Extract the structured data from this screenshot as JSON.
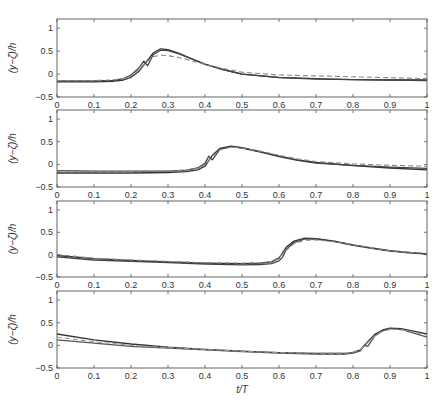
{
  "chart_data": [
    {
      "type": "line",
      "panel": 1,
      "ylabel": "(y−ζ)/h",
      "xlabel": "",
      "xlim": [
        0,
        1
      ],
      "ylim": [
        -0.5,
        1.2
      ],
      "xticks": [
        "0",
        "0.1",
        "0.2",
        "0.3",
        "0.4",
        "0.5",
        "0.6",
        "0.7",
        "0.8",
        "0.9",
        "1"
      ],
      "yticks": [
        "−0.5",
        "0",
        "0.5",
        "1"
      ],
      "series": [
        {
          "name": "solid-1",
          "style": "solid",
          "color": "#333333",
          "x": [
            0,
            0.1,
            0.15,
            0.18,
            0.2,
            0.22,
            0.24,
            0.26,
            0.28,
            0.3,
            0.33,
            0.36,
            0.4,
            0.45,
            0.5,
            0.6,
            0.7,
            0.8,
            0.9,
            1.0
          ],
          "y": [
            -0.17,
            -0.17,
            -0.16,
            -0.13,
            -0.07,
            0.05,
            0.25,
            0.46,
            0.55,
            0.53,
            0.45,
            0.35,
            0.22,
            0.1,
            0.0,
            -0.07,
            -0.1,
            -0.12,
            -0.13,
            -0.13
          ]
        },
        {
          "name": "solid-2",
          "style": "solid",
          "color": "#444444",
          "x": [
            0,
            0.1,
            0.15,
            0.18,
            0.2,
            0.22,
            0.235,
            0.245,
            0.26,
            0.28,
            0.3,
            0.33,
            0.36,
            0.4,
            0.45,
            0.5,
            0.6,
            0.7,
            0.8,
            0.9,
            1.0
          ],
          "y": [
            -0.15,
            -0.15,
            -0.14,
            -0.1,
            -0.02,
            0.12,
            0.28,
            0.18,
            0.42,
            0.52,
            0.51,
            0.44,
            0.34,
            0.21,
            0.09,
            0.0,
            -0.08,
            -0.11,
            -0.12,
            -0.13,
            -0.14
          ]
        },
        {
          "name": "dashed",
          "style": "dashed",
          "color": "#888888",
          "x": [
            0,
            0.1,
            0.15,
            0.18,
            0.2,
            0.22,
            0.24,
            0.26,
            0.28,
            0.3,
            0.33,
            0.36,
            0.4,
            0.45,
            0.5,
            0.6,
            0.7,
            0.8,
            0.9,
            1.0
          ],
          "y": [
            -0.14,
            -0.14,
            -0.13,
            -0.1,
            -0.04,
            0.08,
            0.25,
            0.38,
            0.41,
            0.4,
            0.36,
            0.3,
            0.21,
            0.12,
            0.04,
            -0.02,
            -0.04,
            -0.06,
            -0.08,
            -0.1
          ]
        }
      ]
    },
    {
      "type": "line",
      "panel": 2,
      "ylabel": "(y−ζ)/h",
      "xlabel": "",
      "xlim": [
        0,
        1
      ],
      "ylim": [
        -0.5,
        1.2
      ],
      "xticks": [
        "0",
        "0.1",
        "0.2",
        "0.3",
        "0.4",
        "0.5",
        "0.6",
        "0.7",
        "0.8",
        "0.9",
        "1"
      ],
      "yticks": [
        "−0.5",
        "0",
        "0.5",
        "1"
      ],
      "series": [
        {
          "name": "solid-1",
          "style": "solid",
          "color": "#333333",
          "x": [
            0,
            0.1,
            0.2,
            0.3,
            0.35,
            0.38,
            0.4,
            0.42,
            0.44,
            0.47,
            0.5,
            0.55,
            0.6,
            0.65,
            0.7,
            0.8,
            0.9,
            1.0
          ],
          "y": [
            -0.19,
            -0.19,
            -0.19,
            -0.18,
            -0.16,
            -0.12,
            -0.04,
            0.2,
            0.35,
            0.4,
            0.37,
            0.28,
            0.18,
            0.1,
            0.04,
            -0.03,
            -0.08,
            -0.12
          ]
        },
        {
          "name": "solid-2",
          "style": "solid",
          "color": "#444444",
          "x": [
            0,
            0.1,
            0.2,
            0.3,
            0.35,
            0.38,
            0.4,
            0.41,
            0.42,
            0.44,
            0.47,
            0.5,
            0.55,
            0.6,
            0.65,
            0.7,
            0.8,
            0.9,
            1.0
          ],
          "y": [
            -0.14,
            -0.15,
            -0.15,
            -0.15,
            -0.13,
            -0.08,
            0.02,
            0.18,
            0.1,
            0.33,
            0.39,
            0.36,
            0.27,
            0.17,
            0.09,
            0.03,
            -0.02,
            -0.06,
            -0.09
          ]
        },
        {
          "name": "dashed",
          "style": "dashed",
          "color": "#888888",
          "x": [
            0,
            0.1,
            0.2,
            0.3,
            0.35,
            0.38,
            0.4,
            0.42,
            0.44,
            0.47,
            0.5,
            0.55,
            0.6,
            0.65,
            0.7,
            0.8,
            0.9,
            1.0
          ],
          "y": [
            -0.15,
            -0.16,
            -0.16,
            -0.15,
            -0.13,
            -0.09,
            0.0,
            0.18,
            0.32,
            0.38,
            0.36,
            0.29,
            0.2,
            0.12,
            0.06,
            0.01,
            -0.02,
            -0.04
          ]
        }
      ]
    },
    {
      "type": "line",
      "panel": 3,
      "ylabel": "(y−ζ)/h",
      "xlabel": "",
      "xlim": [
        0,
        1
      ],
      "ylim": [
        -0.5,
        1.2
      ],
      "xticks": [
        "0",
        "0.1",
        "0.2",
        "0.3",
        "0.4",
        "0.5",
        "0.6",
        "0.7",
        "0.8",
        "0.9",
        "1"
      ],
      "yticks": [
        "−0.5",
        "0",
        "0.5",
        "1"
      ],
      "series": [
        {
          "name": "solid-1",
          "style": "solid",
          "color": "#333333",
          "x": [
            0,
            0.1,
            0.2,
            0.3,
            0.4,
            0.5,
            0.55,
            0.58,
            0.6,
            0.62,
            0.64,
            0.67,
            0.7,
            0.75,
            0.8,
            0.85,
            0.9,
            0.95,
            1.0
          ],
          "y": [
            -0.02,
            -0.09,
            -0.13,
            -0.16,
            -0.19,
            -0.2,
            -0.19,
            -0.16,
            -0.08,
            0.17,
            0.3,
            0.37,
            0.36,
            0.3,
            0.22,
            0.15,
            0.09,
            0.05,
            0.02
          ]
        },
        {
          "name": "solid-2",
          "style": "solid",
          "color": "#444444",
          "x": [
            0,
            0.1,
            0.2,
            0.3,
            0.4,
            0.5,
            0.55,
            0.58,
            0.6,
            0.61,
            0.62,
            0.64,
            0.67,
            0.7,
            0.75,
            0.8,
            0.85,
            0.9,
            0.95,
            1.0
          ],
          "y": [
            -0.05,
            -0.12,
            -0.15,
            -0.18,
            -0.21,
            -0.23,
            -0.22,
            -0.2,
            -0.14,
            -0.05,
            0.12,
            0.27,
            0.35,
            0.35,
            0.29,
            0.21,
            0.14,
            0.08,
            0.04,
            0.01
          ]
        },
        {
          "name": "dashed",
          "style": "dashed",
          "color": "#888888",
          "x": [
            0,
            0.1,
            0.2,
            0.3,
            0.4,
            0.5,
            0.55,
            0.58,
            0.6,
            0.62,
            0.64,
            0.67,
            0.7,
            0.75,
            0.8,
            0.85,
            0.9,
            0.95,
            1.0
          ],
          "y": [
            0.0,
            -0.08,
            -0.12,
            -0.15,
            -0.18,
            -0.19,
            -0.18,
            -0.15,
            -0.06,
            0.1,
            0.24,
            0.32,
            0.33,
            0.29,
            0.22,
            0.15,
            0.09,
            0.05,
            0.03
          ]
        }
      ]
    },
    {
      "type": "line",
      "panel": 4,
      "ylabel": "(y−ζ)/h",
      "xlabel": "t/T",
      "xlim": [
        0,
        1
      ],
      "ylim": [
        -0.5,
        1.2
      ],
      "xticks": [
        "0",
        "0.1",
        "0.2",
        "0.3",
        "0.4",
        "0.5",
        "0.6",
        "0.7",
        "0.8",
        "0.9",
        "1"
      ],
      "yticks": [
        "−0.5",
        "0",
        "0.5",
        "1"
      ],
      "series": [
        {
          "name": "solid-1",
          "style": "solid",
          "color": "#333333",
          "x": [
            0,
            0.1,
            0.2,
            0.3,
            0.4,
            0.5,
            0.6,
            0.7,
            0.78,
            0.8,
            0.82,
            0.84,
            0.86,
            0.88,
            0.9,
            0.93,
            0.96,
            1.0
          ],
          "y": [
            0.25,
            0.12,
            0.03,
            -0.04,
            -0.09,
            -0.13,
            -0.16,
            -0.18,
            -0.18,
            -0.16,
            -0.1,
            0.08,
            0.25,
            0.34,
            0.38,
            0.37,
            0.32,
            0.25
          ]
        },
        {
          "name": "solid-2",
          "style": "solid",
          "color": "#555555",
          "x": [
            0,
            0.1,
            0.2,
            0.3,
            0.4,
            0.5,
            0.6,
            0.7,
            0.78,
            0.8,
            0.82,
            0.83,
            0.84,
            0.86,
            0.88,
            0.9,
            0.93,
            0.96,
            1.0
          ],
          "y": [
            0.12,
            0.05,
            -0.02,
            -0.06,
            -0.1,
            -0.14,
            -0.17,
            -0.19,
            -0.19,
            -0.17,
            -0.12,
            0.0,
            -0.02,
            0.22,
            0.32,
            0.37,
            0.35,
            0.28,
            0.18
          ]
        },
        {
          "name": "dashed",
          "style": "dashed",
          "color": "#999999",
          "x": [
            0,
            0.1,
            0.2,
            0.3,
            0.4,
            0.5,
            0.6,
            0.7,
            0.78,
            0.8,
            0.82,
            0.84,
            0.86,
            0.88,
            0.9,
            0.93,
            0.96,
            1.0
          ],
          "y": [
            0.18,
            0.08,
            0.0,
            -0.05,
            -0.09,
            -0.13,
            -0.16,
            -0.17,
            -0.17,
            -0.15,
            -0.09,
            0.06,
            0.22,
            0.31,
            0.35,
            0.35,
            0.3,
            0.23
          ]
        }
      ]
    }
  ]
}
